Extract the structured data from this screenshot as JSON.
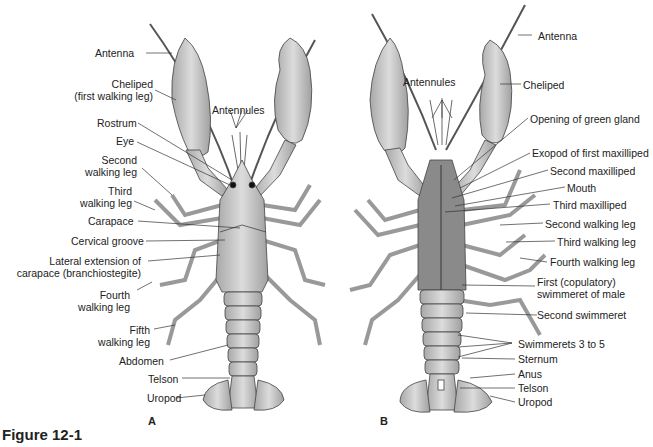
{
  "figure": {
    "caption": "Figure 12-1"
  },
  "panels": [
    {
      "id": "A",
      "view": "dorsal",
      "label": "A",
      "annotations": [
        {
          "text": "Antenna"
        },
        {
          "text": "Cheliped\n(first walking leg)",
          "line1": "Cheliped",
          "line2": "(first walking leg)"
        },
        {
          "text": "Antennules"
        },
        {
          "text": "Rostrum"
        },
        {
          "text": "Eye"
        },
        {
          "text": "Second walking leg",
          "line1": "Second",
          "line2": "walking leg"
        },
        {
          "text": "Third walking leg",
          "line1": "Third",
          "line2": "walking leg"
        },
        {
          "text": "Carapace"
        },
        {
          "text": "Cervical groove"
        },
        {
          "text": "Lateral extension of carapace (branchiostegite)",
          "line1": "Lateral extension of",
          "line2": "carapace (branchiostegite)"
        },
        {
          "text": "Fourth walking leg",
          "line1": "Fourth",
          "line2": "walking leg"
        },
        {
          "text": "Fifth walking leg",
          "line1": "Fifth",
          "line2": "walking leg"
        },
        {
          "text": "Abdomen"
        },
        {
          "text": "Telson"
        },
        {
          "text": "Uropod"
        }
      ]
    },
    {
      "id": "B",
      "view": "ventral",
      "label": "B",
      "annotations": [
        {
          "text": "Antenna"
        },
        {
          "text": "Antennules"
        },
        {
          "text": "Cheliped"
        },
        {
          "text": "Opening of green gland"
        },
        {
          "text": "Exopod of first maxilliped"
        },
        {
          "text": "Second maxilliped"
        },
        {
          "text": "Mouth"
        },
        {
          "text": "Third maxilliped"
        },
        {
          "text": "Second walking leg"
        },
        {
          "text": "Third walking leg"
        },
        {
          "text": "Fourth walking leg"
        },
        {
          "text": "First (copulatory) swimmeret of male",
          "line1": "First (copulatory)",
          "line2": "swimmeret of male"
        },
        {
          "text": "Second swimmeret"
        },
        {
          "text": "Swimmerets 3 to 5"
        },
        {
          "text": "Sternum"
        },
        {
          "text": "Anus"
        },
        {
          "text": "Telson"
        },
        {
          "text": "Uropod"
        }
      ]
    }
  ],
  "colors": {
    "line": "#333333",
    "body": "#c8c8c8",
    "shade": "#9a9a9a",
    "text": "#222222"
  }
}
